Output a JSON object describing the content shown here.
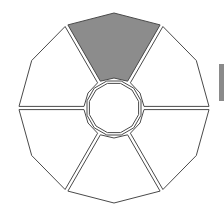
{
  "diagram": {
    "type": "segmented-dodecagon-wheel",
    "center": [
      114,
      108
    ],
    "outer_radius": 95,
    "inner_radius": 27,
    "segment_count": 6,
    "colors": {
      "stroke": "#4a4a4a",
      "highlight_fill": "#8c8c8c",
      "default_fill": "#ffffff",
      "side_tab": "#8a8a8a"
    },
    "segments": [
      {
        "id": "top",
        "highlighted": true
      },
      {
        "id": "upper-right",
        "highlighted": false
      },
      {
        "id": "lower-right",
        "highlighted": false
      },
      {
        "id": "bottom",
        "highlighted": false
      },
      {
        "id": "lower-left",
        "highlighted": false
      },
      {
        "id": "upper-left",
        "highlighted": false
      }
    ],
    "hub": {
      "id": "center-hub",
      "highlighted": false
    }
  }
}
